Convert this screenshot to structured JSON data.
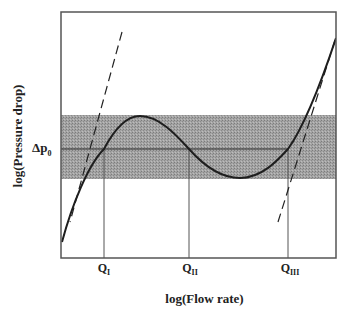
{
  "diagram": {
    "type": "pressure-drop vs flow-rate characteristic (log-log)",
    "y_axis_label": "log(Pressure drop)",
    "x_axis_label": "log(Flow rate)",
    "reference_level": {
      "symbol": "Δp",
      "subscript": "0"
    },
    "flow_markers": [
      {
        "symbol": "Q",
        "subscript": "I"
      },
      {
        "symbol": "Q",
        "subscript": "II"
      },
      {
        "symbol": "Q",
        "subscript": "III"
      }
    ],
    "elements": {
      "band": "shaded band of pressure drops around Δp0",
      "curve": "S-shaped (N-shaped) pressure-drop curve with local maximum and minimum",
      "asymptotes": [
        "dashed tangent at low flow",
        "dashed tangent at high flow"
      ]
    },
    "colors": {
      "band": "#9c9c9c",
      "lines": "#1e1e1e",
      "frame": "#555555"
    }
  }
}
